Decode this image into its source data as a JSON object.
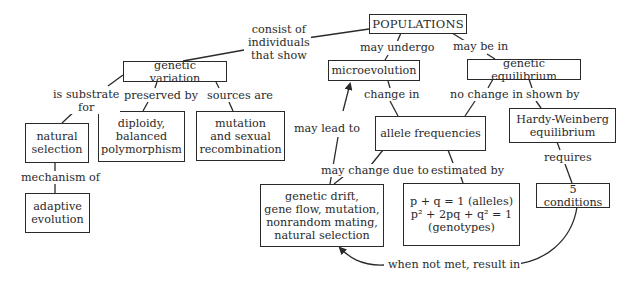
{
  "diagram": {
    "type": "concept-map",
    "nodes": {
      "populations": {
        "label": "POPULATIONS"
      },
      "genetic_variation": {
        "label": "genetic variation"
      },
      "microevolution": {
        "label": "microevolution"
      },
      "genetic_equilibrium": {
        "label": "genetic equilibrium"
      },
      "natural_selection": {
        "lines": [
          "natural",
          "selection"
        ]
      },
      "diploidy": {
        "lines": [
          "diploidy,",
          "balanced",
          "polymorphism"
        ]
      },
      "mutation_sources": {
        "lines": [
          "mutation",
          "and sexual",
          "recombination"
        ]
      },
      "allele_frequencies": {
        "label": "allele frequencies"
      },
      "hardy_weinberg": {
        "lines": [
          "Hardy-Weinberg",
          "equilibrium"
        ]
      },
      "adaptive_evolution": {
        "lines": [
          "adaptive",
          "evolution"
        ]
      },
      "mechanisms": {
        "lines": [
          "genetic drift,",
          "gene flow, mutation,",
          "nonrandom mating,",
          "natural selection"
        ]
      },
      "equations": {
        "line1": "p + q  = 1 (alleles)",
        "line2": "p² + 2pq + q² = 1",
        "line3": "(genotypes)"
      },
      "five_conditions": {
        "label": "5 conditions"
      }
    },
    "links": {
      "consist_of": {
        "lines": [
          "consist of",
          "individuals",
          "that show"
        ]
      },
      "may_undergo": {
        "label": "may undergo"
      },
      "may_be_in": {
        "label": "may be in"
      },
      "is_substrate_for": {
        "lines": [
          "is substrate",
          "for"
        ]
      },
      "preserved_by": {
        "label": "preserved by"
      },
      "sources_are": {
        "label": "sources are"
      },
      "change_in": {
        "label": "change in"
      },
      "no_change_in": {
        "label": "no change in"
      },
      "shown_by": {
        "label": "shown by"
      },
      "mechanism_of": {
        "label": "mechanism of"
      },
      "may_lead_to": {
        "label": "may lead to"
      },
      "may_change_due_to": {
        "label": "may change due to"
      },
      "estimated_by": {
        "label": "estimated by"
      },
      "requires": {
        "label": "requires"
      },
      "when_not_met": {
        "label": "when not met, result in"
      }
    },
    "colors": {
      "stroke": "#2a2a2a",
      "background": "#ffffff",
      "text": "#2a2a2a"
    }
  }
}
